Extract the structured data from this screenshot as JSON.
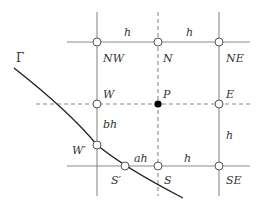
{
  "diagram": {
    "type": "finite-difference-stencil",
    "colors": {
      "grid": "#8a8a8a",
      "dashed": "#8a8a8a",
      "curve": "#222222",
      "center_point": "#000000",
      "label": "#333333"
    },
    "boundary_label": "Γ",
    "nodes": [
      {
        "id": "NW",
        "label": "NW",
        "x": 97,
        "y": 42,
        "lx": 103,
        "ly": 62,
        "kind": "open"
      },
      {
        "id": "N",
        "label": "N",
        "x": 158,
        "y": 42,
        "lx": 163,
        "ly": 62,
        "kind": "open"
      },
      {
        "id": "NE",
        "label": "NE",
        "x": 219,
        "y": 42,
        "lx": 226,
        "ly": 62,
        "kind": "open"
      },
      {
        "id": "W",
        "label": "W",
        "x": 97,
        "y": 104,
        "lx": 103,
        "ly": 98,
        "kind": "open"
      },
      {
        "id": "P",
        "label": "P",
        "x": 158,
        "y": 104,
        "lx": 163,
        "ly": 98,
        "kind": "filled"
      },
      {
        "id": "E",
        "label": "E",
        "x": 219,
        "y": 104,
        "lx": 226,
        "ly": 98,
        "kind": "open"
      },
      {
        "id": "Wp",
        "label": "W′",
        "x": 97,
        "y": 145,
        "lx": 72,
        "ly": 154,
        "kind": "open"
      },
      {
        "id": "Sp",
        "label": "S′",
        "x": 125,
        "y": 166,
        "lx": 111,
        "ly": 184,
        "kind": "open"
      },
      {
        "id": "S",
        "label": "S",
        "x": 158,
        "y": 166,
        "lx": 164,
        "ly": 184,
        "kind": "open"
      },
      {
        "id": "SE",
        "label": "SE",
        "x": 219,
        "y": 166,
        "lx": 226,
        "ly": 184,
        "kind": "open"
      }
    ],
    "spacing_labels": [
      {
        "id": "h-top-left",
        "text": "h",
        "x": 124,
        "y": 36
      },
      {
        "id": "h-top-right",
        "text": "h",
        "x": 186,
        "y": 36
      },
      {
        "id": "bh",
        "text": "bh",
        "x": 103,
        "y": 128
      },
      {
        "id": "h-right",
        "text": "h",
        "x": 226,
        "y": 139
      },
      {
        "id": "ah",
        "text": "ah",
        "x": 134,
        "y": 162
      },
      {
        "id": "h-bottom",
        "text": "h",
        "x": 184,
        "y": 162
      }
    ],
    "gamma_label_pos": {
      "x": 16,
      "y": 62
    }
  }
}
